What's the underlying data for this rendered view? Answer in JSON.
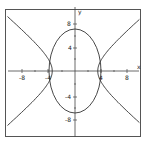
{
  "chart_data": {
    "type": "line",
    "title": "",
    "xlabel": "x",
    "ylabel": "y",
    "xlim": [
      -10,
      10
    ],
    "ylim": [
      -10,
      10
    ],
    "grid": false,
    "x_ticks": [
      -8,
      -4,
      4,
      8
    ],
    "y_ticks": [
      8,
      4,
      -4,
      -8
    ],
    "x_tick_labels": [
      "-8",
      "-4",
      "4",
      "8"
    ],
    "y_tick_labels": [
      "8",
      "4",
      "-4",
      "-8"
    ],
    "series": [
      {
        "name": "ellipse",
        "equation": "x^2/16 + y^2/40 = 1",
        "semi_axis_x": 4,
        "semi_axis_y": 6.3
      },
      {
        "name": "hyperbola",
        "equation": "x^2/12 - y^2/9 = 1",
        "vertex_x": 3.5,
        "opens": "left-right"
      }
    ]
  },
  "labels": {
    "x_axis": "x",
    "y_axis": "y",
    "xt_m8": "-8",
    "xt_m4": "-4",
    "xt_4": "4",
    "xt_8": "8",
    "yt_8": "8",
    "yt_4": "4",
    "yt_m4": "-4",
    "yt_m8": "-8"
  },
  "colors": {
    "curve": "#333333",
    "axis": "#444444",
    "frame": "#555555"
  }
}
